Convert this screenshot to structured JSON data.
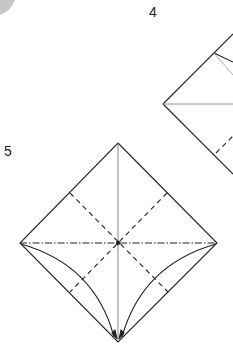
{
  "diagram": {
    "type": "origami-instructions",
    "steps": [
      {
        "number": "4",
        "description": "Partially visible square base diagram with fold lines, cut off at right edge"
      },
      {
        "number": "5",
        "description": "Diamond with valley folds along diagonals (dashed), mountain fold along horizontal (dash-dot), center crease vertical, curved arrows bringing side edges to bottom point"
      }
    ],
    "line_styles": {
      "edge": "solid",
      "valley_fold": "dashed",
      "mountain_fold": "dash-dot"
    },
    "colors": {
      "line": "#222222",
      "crease": "#777777",
      "corner_shape": "#b8b8b8"
    }
  },
  "labels": {
    "step4": "4",
    "step5": "5"
  }
}
